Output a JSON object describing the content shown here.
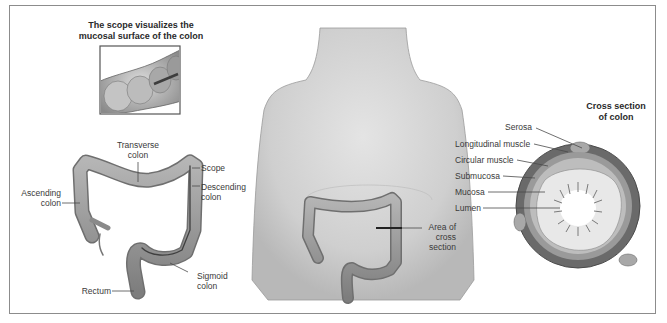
{
  "figure": {
    "inset": {
      "title_line1": "The scope visualizes the",
      "title_line2": "mucosal surface of the colon"
    },
    "colon_labels": {
      "transverse_line1": "Transverse",
      "transverse_line2": "colon",
      "scope": "Scope",
      "descending_line1": "Descending",
      "descending_line2": "colon",
      "ascending_line1": "Ascending",
      "ascending_line2": "colon",
      "sigmoid_line1": "Sigmoid",
      "sigmoid_line2": "colon",
      "rectum": "Rectum"
    },
    "torso_labels": {
      "area_line1": "Area of",
      "area_line2": "cross",
      "area_line3": "section"
    },
    "cross_section": {
      "title_line1": "Cross section",
      "title_line2": "of colon",
      "layers": [
        "Serosa",
        "Longitudinal muscle",
        "Circular muscle",
        "Submucosa",
        "Mucosa",
        "Lumen"
      ]
    }
  },
  "colors": {
    "frame": "#8c8c8c",
    "skin": "#d6d6d6",
    "colon": "#9a9a9a",
    "colon_dark": "#6f6f6f",
    "muscle": "#5e5e5e",
    "submucosa": "#b9b9b9",
    "mucosa": "#e6e6e6",
    "text": "#3a3a3a"
  }
}
